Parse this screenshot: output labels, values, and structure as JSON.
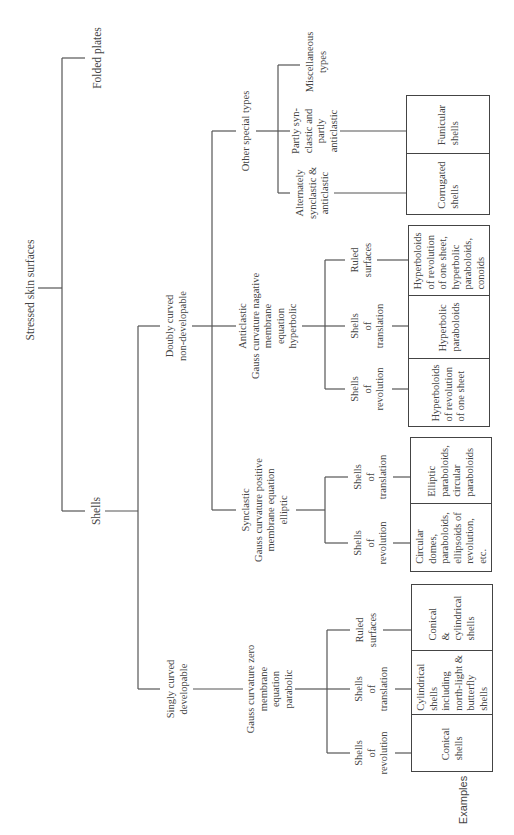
{
  "diagram": {
    "root": "Stressed skin surfaces",
    "level1": {
      "folded_plates": "Folded plates",
      "shells": "Shells"
    },
    "level2": {
      "doubly_curved": "Doubly curved\nnon-developable",
      "singly_curved": "Singly curved\ndevelopable"
    },
    "level3": {
      "other_special": "Other special types",
      "anticlastic": "Anticlastic\nGauss curvature nagative\nmembrane\nequation\nhyperbolic",
      "synclastic": "Synclastic\nGauss curvature positive\nmembrane equation\nelliptic",
      "parabolic": "Gauss curvature zero\nmembrane\nequation\nparabolic"
    },
    "other_special_children": {
      "misc": "Miscellaneous\ntypes",
      "partly": "Partly syn-\nclastic and\npartly\nanticlastic",
      "alternately": "Alternately\nsynclastic &\nanticlastic"
    },
    "anticlastic_children": {
      "ruled": "Ruled\nsurfaces",
      "translation": "Shells\nof\ntranslation",
      "revolution": "Shells\nof\nrevolution"
    },
    "synclastic_children": {
      "translation": "Shells\nof\ntranslation",
      "revolution": "Shells\nof\nrevolution"
    },
    "parabolic_children": {
      "ruled": "Ruled\nsurfaces",
      "translation": "Shells\nof\ntranslation",
      "revolution": "Shells\nof\nrevolution"
    },
    "examples_label": "Examples",
    "examples": {
      "funicular": "Funicular\nshells",
      "corrugated": "Corrugated\nshells",
      "hyp_ruled": "Hyperboloids\nof revolution\nof one sheet,\nhyperbolic\nparaboloids,\nconoids",
      "hyp_translation": "Hyperbolic\nparaboloids",
      "hyp_revolution": "Hyperboloids\nof revolution\nof one sheet",
      "ell_translation": "Elliptic\nparaboloids,\ncircular\nparaboloids",
      "ell_revolution": "Circular\ndomes,\nparaboloids,\nellipsoids of\nrevolution,\netc.",
      "par_ruled": "Conical\n&\ncylindrical\nshells",
      "par_translation": "Cylindrical\nshells\nincluding\nnorth-light &\nbutterfly\nshells",
      "par_revolution": "Conical\nshells"
    }
  }
}
